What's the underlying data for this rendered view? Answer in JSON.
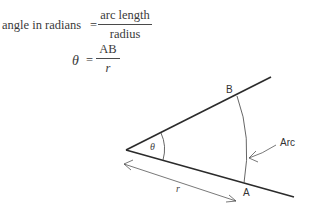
{
  "equations": {
    "eq1": {
      "lhs": "angle in radians",
      "equals": "=",
      "numerator": "arc length",
      "denominator": "radius"
    },
    "eq2": {
      "lhs": "θ",
      "equals": "=",
      "numerator": "AB",
      "denominator": "r"
    }
  },
  "diagram": {
    "labels": {
      "point_b": "B",
      "point_a": "A",
      "angle": "θ",
      "arc": "Arc",
      "radius": "r"
    },
    "colors": {
      "line": "#2b2b2b",
      "thin": "#555555"
    }
  }
}
